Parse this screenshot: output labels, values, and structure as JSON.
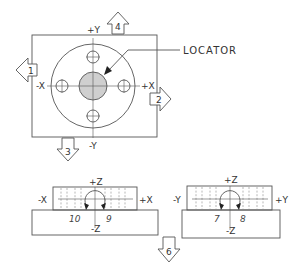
{
  "diagram": {
    "colors": {
      "line": "#555555",
      "locator_fill": "#cfcfcf",
      "background": "#ffffff"
    },
    "top_view": {
      "axis_labels": {
        "pos_y": "+Y",
        "neg_y": "-Y",
        "pos_x": "+X",
        "neg_x": "-X"
      },
      "callout": "LOCATOR",
      "view_arrows": [
        {
          "id": 1,
          "label": "1",
          "direction": "left"
        },
        {
          "id": 2,
          "label": "2",
          "direction": "right"
        },
        {
          "id": 3,
          "label": "3",
          "direction": "down"
        },
        {
          "id": 4,
          "label": "4",
          "direction": "up"
        }
      ],
      "holes": 4
    },
    "front_view_x": {
      "axis_labels": {
        "pos_z": "+Z",
        "neg_z": "-Z",
        "pos_x": "+X",
        "neg_x": "-X"
      },
      "rotation_labels": {
        "ccw": "10",
        "cw": "9"
      }
    },
    "front_view_y": {
      "axis_labels": {
        "pos_z": "+Z",
        "neg_z": "-Z",
        "pos_y": "+Y",
        "neg_y": "-Y"
      },
      "rotation_labels": {
        "ccw": "7",
        "cw": "8"
      }
    },
    "bottom_arrow": {
      "id": 6,
      "label": "6",
      "direction": "down"
    }
  }
}
